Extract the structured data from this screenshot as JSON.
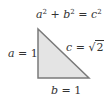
{
  "diagram": {
    "equation": {
      "a": "a",
      "b": "b",
      "c": "c",
      "exponent": "2",
      "plus": " + ",
      "equals": " = "
    },
    "labels": {
      "a": {
        "variable": "a",
        "equals": " = ",
        "value": "1"
      },
      "b": {
        "variable": "b",
        "equals": " = ",
        "value": "1"
      },
      "c": {
        "variable": "c",
        "equals": " = ",
        "radical": "√",
        "radicand": "2"
      }
    },
    "triangle": {
      "vertices": [
        [
          38,
          29
        ],
        [
          38,
          78
        ],
        [
          89,
          78
        ]
      ],
      "fill": "#e4e4e4",
      "stroke": "#7a7a7a"
    }
  }
}
